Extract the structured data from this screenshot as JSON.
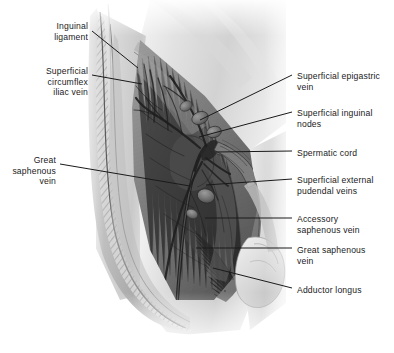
{
  "figure": {
    "background_color": "#ffffff",
    "ink_color": "#1a1a1a",
    "width": 394,
    "height": 353
  },
  "labels": {
    "left": [
      {
        "name": "inguinal-ligament",
        "text": "Inguinal\nligament",
        "x": 8,
        "y": 21,
        "width": 80,
        "leader": {
          "x1": 92,
          "y1": 31,
          "x2": 138,
          "y2": 68
        }
      },
      {
        "name": "superficial-circumflex-iliac-vein",
        "text": "Superficial\ncircumflex\niliac vein",
        "x": 8,
        "y": 66,
        "width": 80,
        "leader": {
          "x1": 92,
          "y1": 75,
          "x2": 142,
          "y2": 84
        }
      },
      {
        "name": "great-saphenous-vein-left",
        "text": "Great\nsaphenous\nvein",
        "x": 8,
        "y": 155,
        "width": 48,
        "leader": {
          "x1": 60,
          "y1": 164,
          "x2": 190,
          "y2": 186
        }
      }
    ],
    "right": [
      {
        "name": "superficial-epigastric-vein",
        "text": "Superficial epigastric\nvein",
        "x": 297,
        "y": 71,
        "leader": {
          "x1": 200,
          "y1": 120,
          "x2": 292,
          "y2": 75
        }
      },
      {
        "name": "superficial-inguinal-nodes",
        "text": "Superficial inguinal\nnodes",
        "x": 297,
        "y": 108,
        "leader": {
          "x1": 199,
          "y1": 137,
          "x2": 292,
          "y2": 112
        }
      },
      {
        "name": "spermatic-cord",
        "text": "Spermatic cord",
        "x": 297,
        "y": 148,
        "leader": {
          "x1": 216,
          "y1": 152,
          "x2": 292,
          "y2": 151
        }
      },
      {
        "name": "superficial-external-pudendal-veins",
        "text": "Superficial external\npudendal veins",
        "x": 297,
        "y": 175,
        "leader": {
          "x1": 206,
          "y1": 185,
          "x2": 292,
          "y2": 179
        }
      },
      {
        "name": "accessory-saphenous-vein",
        "text": "Accessory\nsaphenous vein",
        "x": 297,
        "y": 214,
        "leader": {
          "x1": 205,
          "y1": 218,
          "x2": 292,
          "y2": 218
        }
      },
      {
        "name": "great-saphenous-vein-right",
        "text": "Great saphenous\nvein",
        "x": 297,
        "y": 245,
        "leader": {
          "x1": 196,
          "y1": 248,
          "x2": 292,
          "y2": 248
        }
      },
      {
        "name": "adductor-longus",
        "text": "Adductor longus",
        "x": 297,
        "y": 285,
        "leader": {
          "x1": 213,
          "y1": 268,
          "x2": 292,
          "y2": 288
        }
      }
    ]
  }
}
